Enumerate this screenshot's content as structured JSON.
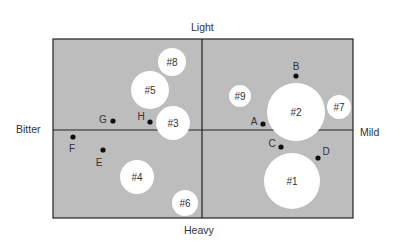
{
  "axes": {
    "top": "Light",
    "bottom": "Heavy",
    "left": "Bitter",
    "right": "Mild"
  },
  "colors": {
    "background": "#bdbdbd",
    "circle": "#ffffff",
    "dot": "#111111",
    "border": "#222222"
  },
  "chart_data": {
    "type": "perceptual-map",
    "x_axis": {
      "negative": "Bitter",
      "positive": "Mild"
    },
    "y_axis": {
      "positive": "Light",
      "negative": "Heavy"
    },
    "ideal_point_segments": [
      {
        "label": "#1",
        "x": 0.6,
        "y": -0.6,
        "size": "large"
      },
      {
        "label": "#2",
        "x": 0.62,
        "y": 0.2,
        "size": "large"
      },
      {
        "label": "#3",
        "x": -0.19,
        "y": 0.08,
        "size": "medium"
      },
      {
        "label": "#4",
        "x": -0.43,
        "y": -0.55,
        "size": "medium"
      },
      {
        "label": "#5",
        "x": -0.35,
        "y": 0.44,
        "size": "medium"
      },
      {
        "label": "#6",
        "x": -0.11,
        "y": -0.84,
        "size": "small"
      },
      {
        "label": "#7",
        "x": 0.91,
        "y": 0.26,
        "size": "small"
      },
      {
        "label": "#8",
        "x": -0.2,
        "y": 0.76,
        "size": "small"
      },
      {
        "label": "#9",
        "x": 0.25,
        "y": 0.39,
        "size": "small"
      }
    ],
    "brands": [
      {
        "label": "A",
        "x": 0.4,
        "y": 0.07
      },
      {
        "label": "B",
        "x": 0.62,
        "y": 0.6
      },
      {
        "label": "C",
        "x": 0.52,
        "y": -0.19
      },
      {
        "label": "D",
        "x": 0.77,
        "y": -0.32
      },
      {
        "label": "E",
        "x": -0.66,
        "y": -0.23
      },
      {
        "label": "F",
        "x": -0.86,
        "y": -0.08
      },
      {
        "label": "G",
        "x": -0.6,
        "y": 0.11
      },
      {
        "label": "H",
        "x": -0.35,
        "y": 0.09
      }
    ]
  },
  "circles": [
    {
      "label": "#1",
      "cx": 292,
      "cy": 181,
      "r": 28
    },
    {
      "label": "#2",
      "cx": 296,
      "cy": 112,
      "r": 29
    },
    {
      "label": "#3",
      "cx": 173,
      "cy": 123,
      "r": 17
    },
    {
      "label": "#4",
      "cx": 137,
      "cy": 177,
      "r": 17
    },
    {
      "label": "#5",
      "cx": 150,
      "cy": 90,
      "r": 19
    },
    {
      "label": "#6",
      "cx": 185,
      "cy": 203,
      "r": 13
    },
    {
      "label": "#7",
      "cx": 339,
      "cy": 107,
      "r": 12
    },
    {
      "label": "#8",
      "cx": 172,
      "cy": 62,
      "r": 14
    },
    {
      "label": "#9",
      "cx": 240,
      "cy": 96,
      "r": 11
    }
  ],
  "points": [
    {
      "label": "A",
      "cx": 263,
      "cy": 124,
      "lx": 254,
      "ly": 125
    },
    {
      "label": "B",
      "cx": 296,
      "cy": 76,
      "lx": 296,
      "ly": 70
    },
    {
      "label": "C",
      "cx": 281,
      "cy": 147,
      "lx": 272,
      "ly": 147
    },
    {
      "label": "D",
      "cx": 318,
      "cy": 158,
      "lx": 326,
      "ly": 155
    },
    {
      "label": "E",
      "cx": 103,
      "cy": 150,
      "lx": 99,
      "ly": 166
    },
    {
      "label": "F",
      "cx": 73,
      "cy": 137,
      "lx": 72,
      "ly": 152
    },
    {
      "label": "G",
      "cx": 113,
      "cy": 121,
      "lx": 103,
      "ly": 123
    },
    {
      "label": "H",
      "cx": 150,
      "cy": 122,
      "lx": 141,
      "ly": 120
    }
  ]
}
